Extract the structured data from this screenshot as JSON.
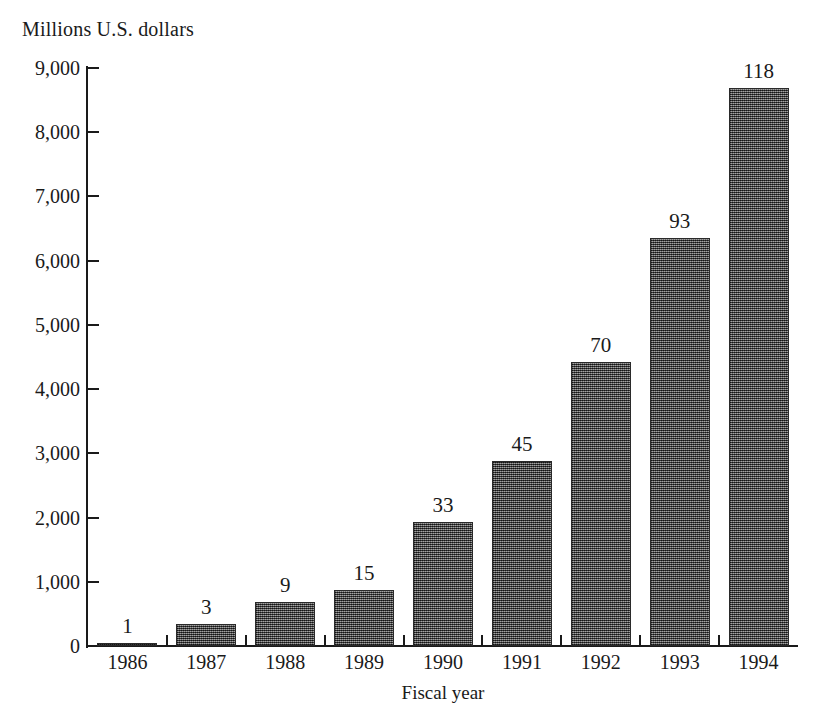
{
  "chart_data": {
    "type": "bar",
    "title": "",
    "subtitle": "",
    "ylabel": "Millions U.S. dollars",
    "xlabel": "Fiscal year",
    "categories": [
      "1986",
      "1987",
      "1988",
      "1989",
      "1990",
      "1991",
      "1992",
      "1993",
      "1994"
    ],
    "values": [
      30,
      340,
      680,
      870,
      1930,
      2880,
      4420,
      6350,
      8690
    ],
    "point_labels": [
      "1",
      "3",
      "9",
      "15",
      "33",
      "45",
      "70",
      "93",
      "118"
    ],
    "ylim": [
      0,
      9000
    ],
    "ytick_values": [
      0,
      1000,
      2000,
      3000,
      4000,
      5000,
      6000,
      7000,
      8000,
      9000
    ],
    "ytick_labels": [
      "0",
      "1,000",
      "2,000",
      "3,000",
      "4,000",
      "5,000",
      "6,000",
      "7,000",
      "8,000",
      "9,000"
    ],
    "grid": false,
    "legend": false,
    "legend_position": "none",
    "bar_color": "#555555",
    "axis_color": "#1a1a1a",
    "background_color": "#ffffff"
  }
}
